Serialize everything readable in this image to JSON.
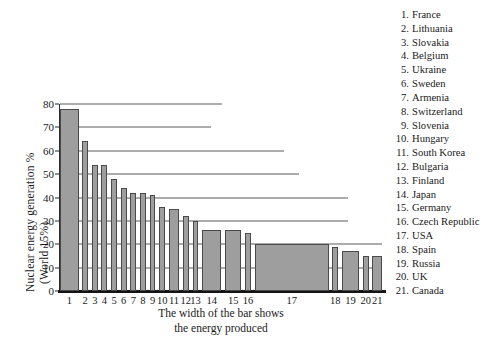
{
  "chart_data": {
    "type": "bar",
    "title": "",
    "xlabel": "The width of the bar shows\nthe energy produced",
    "xlabel_line1": "The width of the bar shows",
    "xlabel_line2": "the energy produced",
    "ylabel_line1": "Nuclear energy  generation %",
    "ylabel_line2": "(World 15%)",
    "ylim": [
      0,
      80
    ],
    "yticks": [
      0,
      10,
      20,
      30,
      40,
      50,
      60,
      70,
      80
    ],
    "ytick_labels": [
      "0",
      "10",
      "20",
      "30",
      "40",
      "50",
      "60",
      "70",
      "80"
    ],
    "grid": true,
    "grid_orientation": "horizontal",
    "legend_position": "right",
    "bar_color": "#9e9e9e",
    "bar_edge_color": "#4a4a4a",
    "axis_color": "#141414",
    "grid_color": "#5a5a5a",
    "note": "Bar height = nuclear share of electricity (%); bar width = total energy produced",
    "categories": [
      "1",
      "2",
      "3",
      "4",
      "5",
      "6",
      "7",
      "8",
      "9",
      "10",
      "11",
      "12",
      "13",
      "14",
      "15",
      "16",
      "17",
      "18",
      "19",
      "20",
      "21"
    ],
    "values": [
      78,
      64,
      54,
      54,
      48,
      44,
      42,
      42,
      41,
      36,
      35,
      32,
      30,
      26,
      26,
      25,
      20,
      19,
      17,
      15,
      15
    ],
    "widths": [
      5.0,
      1.6,
      1.6,
      1.6,
      1.6,
      1.6,
      1.6,
      1.6,
      1.6,
      1.6,
      2.8,
      1.6,
      1.6,
      5.2,
      4.4,
      1.6,
      20.0,
      1.6,
      4.6,
      1.6,
      2.6
    ],
    "points": [
      {
        "rank": 1,
        "country": "France",
        "value": 78,
        "width": 5.0
      },
      {
        "rank": 2,
        "country": "Lithuania",
        "value": 64,
        "width": 1.6
      },
      {
        "rank": 3,
        "country": "Slovakia",
        "value": 54,
        "width": 1.6
      },
      {
        "rank": 4,
        "country": "Belgium",
        "value": 54,
        "width": 1.6
      },
      {
        "rank": 5,
        "country": "Ukraine",
        "value": 48,
        "width": 1.6
      },
      {
        "rank": 6,
        "country": "Sweden",
        "value": 44,
        "width": 1.6
      },
      {
        "rank": 7,
        "country": "Armenia",
        "value": 42,
        "width": 1.6
      },
      {
        "rank": 8,
        "country": "Switzerland",
        "value": 42,
        "width": 1.6
      },
      {
        "rank": 9,
        "country": "Slovenia",
        "value": 41,
        "width": 1.6
      },
      {
        "rank": 10,
        "country": "Hungary",
        "value": 36,
        "width": 1.6
      },
      {
        "rank": 11,
        "country": "South Korea",
        "value": 35,
        "width": 2.8
      },
      {
        "rank": 12,
        "country": "Bulgaria",
        "value": 32,
        "width": 1.6
      },
      {
        "rank": 13,
        "country": "Finland",
        "value": 30,
        "width": 1.6
      },
      {
        "rank": 14,
        "country": "Japan",
        "value": 26,
        "width": 5.2
      },
      {
        "rank": 15,
        "country": "Germany",
        "value": 26,
        "width": 4.4
      },
      {
        "rank": 16,
        "country": "Czech Republic",
        "value": 25,
        "width": 1.6
      },
      {
        "rank": 17,
        "country": "USA",
        "value": 20,
        "width": 20.0
      },
      {
        "rank": 18,
        "country": "Spain",
        "value": 19,
        "width": 1.6
      },
      {
        "rank": 19,
        "country": "Russia",
        "value": 17,
        "width": 4.6
      },
      {
        "rank": 20,
        "country": "UK",
        "value": 15,
        "width": 1.6
      },
      {
        "rank": 21,
        "country": "Canada",
        "value": 15,
        "width": 2.6
      }
    ],
    "legend_entries": [
      {
        "num": "1.",
        "name": "France"
      },
      {
        "num": "2.",
        "name": "Lithuania"
      },
      {
        "num": "3.",
        "name": "Slovakia"
      },
      {
        "num": "4.",
        "name": "Belgium"
      },
      {
        "num": "5.",
        "name": "Ukraine"
      },
      {
        "num": "6.",
        "name": "Sweden"
      },
      {
        "num": "7.",
        "name": "Armenia"
      },
      {
        "num": "8.",
        "name": "Switzerland"
      },
      {
        "num": "9.",
        "name": "Slovenia"
      },
      {
        "num": "10.",
        "name": "Hungary"
      },
      {
        "num": "11.",
        "name": "South Korea"
      },
      {
        "num": "12.",
        "name": "Bulgaria"
      },
      {
        "num": "13.",
        "name": "Finland"
      },
      {
        "num": "14.",
        "name": "Japan"
      },
      {
        "num": "15.",
        "name": "Germany"
      },
      {
        "num": "16.",
        "name": "Czech Republic"
      },
      {
        "num": "17.",
        "name": "USA"
      },
      {
        "num": "18.",
        "name": "Spain"
      },
      {
        "num": "19.",
        "name": "Russia"
      },
      {
        "num": "20.",
        "name": "UK"
      },
      {
        "num": "21.",
        "name": "Canada"
      }
    ]
  }
}
